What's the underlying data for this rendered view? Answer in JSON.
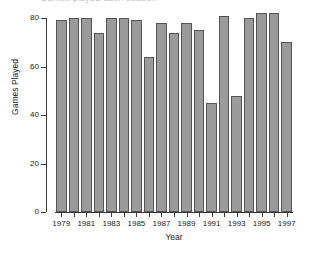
{
  "chart_data": {
    "type": "bar",
    "title": "Games played each season",
    "xlabel": "Year",
    "ylabel": "Games Played",
    "categories": [
      "1979",
      "1980",
      "1981",
      "1982",
      "1983",
      "1984",
      "1985",
      "1986",
      "1987",
      "1988",
      "1989",
      "1990",
      "1991",
      "1992",
      "1993",
      "1994",
      "1995",
      "1996",
      "1997"
    ],
    "values": [
      79,
      80,
      80,
      74,
      80,
      80,
      79,
      64,
      78,
      74,
      78,
      75,
      45,
      81,
      48,
      80,
      82,
      82,
      70
    ],
    "ylim": [
      0,
      80
    ],
    "y_ticks": [
      0,
      20,
      40,
      60,
      80
    ],
    "y_tick_labels": [
      "0",
      "20",
      "40",
      "60",
      "80"
    ],
    "x_tick_labels": [
      "1979",
      "1981",
      "1983",
      "1985",
      "1987",
      "1989",
      "1991",
      "1993",
      "1995",
      "1997"
    ],
    "x_labeled_categories": [
      "1979",
      "1981",
      "1983",
      "1985",
      "1987",
      "1989",
      "1991",
      "1993",
      "1995",
      "1997"
    ],
    "grid": false,
    "legend": false,
    "bar_color": "#9b9b9b",
    "bar_edge_color": "#555555",
    "axis_color": "#3a3a3a",
    "background_color": "#ffffff"
  }
}
